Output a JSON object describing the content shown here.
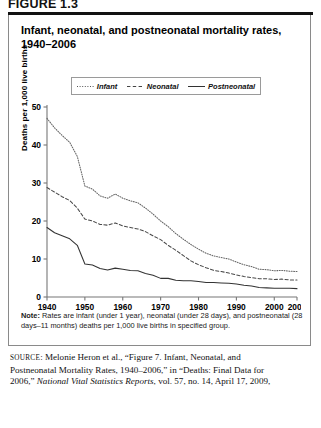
{
  "figure_label": "FIGURE 1.3",
  "title": "Infant, neonatal, and postneonatal mortality rates, 1940–2006",
  "legend": {
    "items": [
      {
        "label": "Infant",
        "style": "dotted"
      },
      {
        "label": "Neonatal",
        "style": "dashed"
      },
      {
        "label": "Postneonatal",
        "style": "solid"
      }
    ]
  },
  "note": {
    "prefix": "Note:",
    "text": " Rates are infant (under 1 year), neonatal (under 28 days), and postneonatal (28 days–11 months) deaths per 1,000 live births in specified group."
  },
  "source": {
    "prefix": "SOURCE",
    "line1": ": Melonie Heron et al., “Figure 7. Infant, Neonatal, and",
    "line2": "Postneonatal Mortality Rates, 1940–2006,” in “Deaths: Final Data for",
    "line3_pre": "2006,” ",
    "line3_italic": "National Vital Statistics Reports",
    "line3_post": ", vol. 57, no. 14, April 17, 2009,"
  },
  "chart_data": {
    "type": "line",
    "title": "Infant, neonatal, and postneonatal mortality rates, 1940–2006",
    "xlabel": "",
    "ylabel": "Deaths per 1,000 live births",
    "xlim": [
      1940,
      2006
    ],
    "ylim": [
      0,
      50
    ],
    "yticks": [
      0,
      10,
      20,
      30,
      40,
      50
    ],
    "xticks": [
      1940,
      1950,
      1960,
      1970,
      1980,
      1990,
      2000,
      2006
    ],
    "grid": false,
    "legend_position": "top",
    "x": [
      1940,
      1942,
      1944,
      1946,
      1948,
      1950,
      1952,
      1954,
      1956,
      1958,
      1960,
      1962,
      1964,
      1966,
      1968,
      1970,
      1972,
      1974,
      1976,
      1978,
      1980,
      1982,
      1984,
      1986,
      1988,
      1990,
      1992,
      1994,
      1996,
      1998,
      2000,
      2002,
      2004,
      2006
    ],
    "series": [
      {
        "name": "Infant",
        "style": "dotted",
        "values": [
          47.0,
          44.5,
          42.5,
          40.7,
          37.0,
          29.2,
          28.4,
          26.6,
          26.0,
          27.1,
          26.0,
          25.3,
          24.8,
          23.4,
          21.8,
          20.0,
          18.5,
          16.7,
          15.2,
          13.8,
          12.6,
          11.5,
          10.8,
          10.4,
          10.0,
          9.2,
          8.5,
          8.0,
          7.3,
          7.2,
          6.9,
          7.0,
          6.8,
          6.7
        ]
      },
      {
        "name": "Neonatal",
        "style": "dashed",
        "values": [
          28.8,
          27.6,
          26.4,
          25.4,
          23.4,
          20.5,
          20.0,
          19.1,
          18.9,
          19.5,
          18.7,
          18.3,
          17.9,
          17.2,
          16.1,
          15.1,
          13.6,
          12.3,
          10.9,
          9.5,
          8.5,
          7.7,
          7.0,
          6.7,
          6.3,
          5.8,
          5.4,
          5.1,
          4.8,
          4.8,
          4.6,
          4.7,
          4.5,
          4.5
        ]
      },
      {
        "name": "Postneonatal",
        "style": "solid",
        "values": [
          18.3,
          16.9,
          16.1,
          15.3,
          13.6,
          8.7,
          8.4,
          7.5,
          7.1,
          7.6,
          7.3,
          7.0,
          6.9,
          6.2,
          5.7,
          4.9,
          4.9,
          4.4,
          4.3,
          4.3,
          4.1,
          3.8,
          3.8,
          3.7,
          3.6,
          3.4,
          3.1,
          2.9,
          2.5,
          2.4,
          2.3,
          2.3,
          2.3,
          2.2
        ]
      }
    ]
  }
}
